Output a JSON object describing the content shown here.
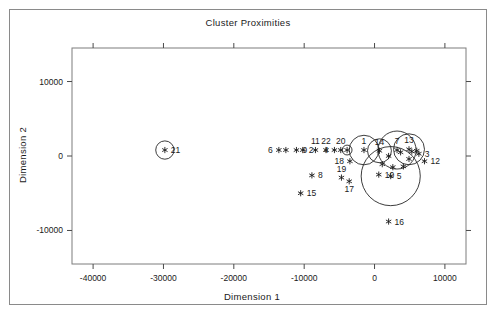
{
  "figure": {
    "border_color": "#8a8a8a",
    "background": "#ffffff"
  },
  "chart_data": {
    "type": "scatter",
    "title": "Cluster Proximities",
    "xlabel": "Dimension 1",
    "ylabel": "Dimension 2",
    "xlim": [
      -43000,
      13000
    ],
    "ylim": [
      -14500,
      14500
    ],
    "xticks": [
      -40000,
      -30000,
      -20000,
      -10000,
      0,
      10000
    ],
    "xticklabels": [
      "-40000",
      "-30000",
      "-20000",
      "-10000",
      "0",
      "10000"
    ],
    "yticks": [
      10000,
      0,
      -10000
    ],
    "yticklabels": [
      "10000",
      "0",
      "-10000"
    ],
    "grid": false,
    "legend": null,
    "marker_style": "asterisk",
    "points": [
      {
        "label": "21",
        "x": -29800,
        "y": 800,
        "label_pos": "right",
        "bubble_r": 1300
      },
      {
        "label": "6",
        "x": -13600,
        "y": 800,
        "label_pos": "left",
        "bubble_r": 0
      },
      {
        "label": "",
        "x": -12600,
        "y": 800,
        "label_pos": "none",
        "bubble_r": 0
      },
      {
        "label": "9",
        "x": -11100,
        "y": 800,
        "label_pos": "right",
        "bubble_r": 0
      },
      {
        "label": "2",
        "x": -10200,
        "y": 800,
        "label_pos": "right",
        "bubble_r": 0
      },
      {
        "label": "11",
        "x": -8400,
        "y": 800,
        "label_pos": "above",
        "bubble_r": 0
      },
      {
        "label": "22",
        "x": -6900,
        "y": 800,
        "label_pos": "above",
        "bubble_r": 0
      },
      {
        "label": "4",
        "x": -5700,
        "y": 800,
        "label_pos": "left",
        "bubble_r": 0
      },
      {
        "label": "20",
        "x": -4800,
        "y": 800,
        "label_pos": "above",
        "bubble_r": 0
      },
      {
        "label": "",
        "x": -3900,
        "y": 800,
        "label_pos": "none",
        "bubble_r": 700
      },
      {
        "label": "1",
        "x": -1500,
        "y": 800,
        "label_pos": "above",
        "bubble_r": 2100
      },
      {
        "label": "14",
        "x": 700,
        "y": 700,
        "label_pos": "above",
        "bubble_r": 1700
      },
      {
        "label": "7",
        "x": 3200,
        "y": 800,
        "label_pos": "above",
        "bubble_r": 2700
      },
      {
        "label": "13",
        "x": 4900,
        "y": 900,
        "label_pos": "above",
        "bubble_r": 2200
      },
      {
        "label": "3",
        "x": 6300,
        "y": 300,
        "label_pos": "right",
        "bubble_r": 0
      },
      {
        "label": "12",
        "x": 7100,
        "y": -700,
        "label_pos": "right",
        "bubble_r": 0
      },
      {
        "label": "18",
        "x": -3500,
        "y": -700,
        "label_pos": "left",
        "bubble_r": 0
      },
      {
        "label": "8",
        "x": -8900,
        "y": -2600,
        "label_pos": "right",
        "bubble_r": 0
      },
      {
        "label": "19",
        "x": -4700,
        "y": -2900,
        "label_pos": "above",
        "bubble_r": 0
      },
      {
        "label": "17",
        "x": -3600,
        "y": -3400,
        "label_pos": "below",
        "bubble_r": 0
      },
      {
        "label": "10",
        "x": 600,
        "y": -2500,
        "label_pos": "right",
        "bubble_r": 0
      },
      {
        "label": "5",
        "x": 2300,
        "y": -2700,
        "label_pos": "right",
        "bubble_r": 4200
      },
      {
        "label": "",
        "x": 1100,
        "y": -1100,
        "label_pos": "none",
        "bubble_r": 0
      },
      {
        "label": "",
        "x": 2600,
        "y": -1500,
        "label_pos": "none",
        "bubble_r": 0
      },
      {
        "label": "",
        "x": 4100,
        "y": -1400,
        "label_pos": "none",
        "bubble_r": 0
      },
      {
        "label": "",
        "x": 4900,
        "y": -400,
        "label_pos": "none",
        "bubble_r": 0
      },
      {
        "label": "",
        "x": 2000,
        "y": 0,
        "label_pos": "none",
        "bubble_r": 0
      },
      {
        "label": "",
        "x": 3700,
        "y": 500,
        "label_pos": "none",
        "bubble_r": 0
      },
      {
        "label": "",
        "x": 5300,
        "y": 600,
        "label_pos": "none",
        "bubble_r": 0
      },
      {
        "label": "",
        "x": 6000,
        "y": 700,
        "label_pos": "none",
        "bubble_r": 0
      },
      {
        "label": "15",
        "x": -10500,
        "y": -5000,
        "label_pos": "right",
        "bubble_r": 0
      },
      {
        "label": "16",
        "x": 2000,
        "y": -8800,
        "label_pos": "right",
        "bubble_r": 0
      }
    ]
  }
}
